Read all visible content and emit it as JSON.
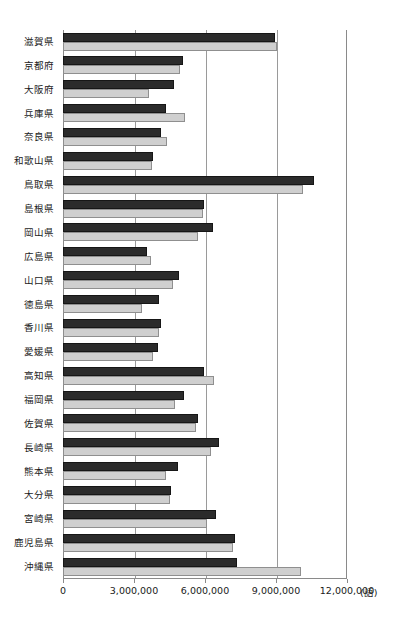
{
  "chart_data": {
    "type": "bar",
    "orientation": "horizontal",
    "title": "",
    "xlabel": "(語)",
    "ylabel": "",
    "xlim": [
      0,
      12000000
    ],
    "xticks": [
      0,
      3000000,
      6000000,
      9000000,
      12000000
    ],
    "xticklabels": [
      "0",
      "3,000,000",
      "6,000,000",
      "9,000,000",
      "12,000,000"
    ],
    "unit_label": "(語)",
    "grid": true,
    "legend": false,
    "colors": {
      "series_dark": "#2b2b2b",
      "series_light": "#cfcfcf",
      "axis": "#8a8a8a",
      "grid": "#9a9a9a",
      "text": "#1a1a1a"
    },
    "categories": [
      "滋賀県",
      "京都府",
      "大阪府",
      "兵庫県",
      "奈良県",
      "和歌山県",
      "鳥取県",
      "島根県",
      "岡山県",
      "広島県",
      "山口県",
      "徳島県",
      "香川県",
      "愛媛県",
      "高知県",
      "福岡県",
      "佐賀県",
      "長崎県",
      "熊本県",
      "大分県",
      "宮崎県",
      "鹿児島県",
      "沖縄県"
    ],
    "series": [
      {
        "name": "series-1",
        "color": "#2b2b2b",
        "values": [
          8950000,
          5050000,
          4700000,
          4350000,
          4150000,
          3800000,
          10600000,
          5950000,
          6350000,
          3550000,
          4900000,
          4050000,
          4150000,
          4000000,
          5950000,
          5100000,
          5700000,
          6600000,
          4850000,
          4550000,
          6450000,
          7250000,
          7350000
        ]
      },
      {
        "name": "series-2",
        "color": "#cfcfcf",
        "values": [
          9050000,
          4950000,
          3650000,
          5150000,
          4400000,
          3750000,
          10150000,
          5900000,
          5700000,
          3700000,
          4650000,
          3350000,
          4050000,
          3800000,
          6400000,
          4750000,
          5600000,
          6250000,
          4350000,
          4500000,
          6100000,
          7200000,
          10050000
        ]
      }
    ]
  }
}
